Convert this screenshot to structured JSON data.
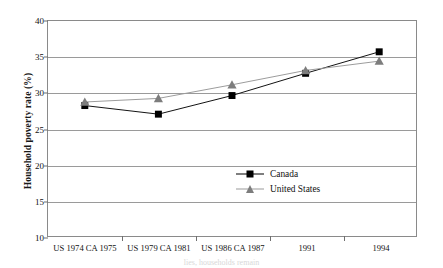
{
  "chart_data": {
    "type": "line",
    "title": "",
    "xlabel": "",
    "ylabel": "Household poverty rate (%)",
    "categories": [
      "US 1974 CA 1975",
      "US 1979 CA 1981",
      "US 1986 CA 1987",
      "1991",
      "1994"
    ],
    "series": [
      {
        "name": "Canada",
        "values": [
          28.2,
          27.0,
          29.6,
          32.7,
          35.7
        ],
        "color": "#000000",
        "marker": "square"
      },
      {
        "name": "United States",
        "values": [
          28.7,
          29.2,
          31.1,
          33.1,
          34.4
        ],
        "color": "#7d7d7d",
        "marker": "triangle"
      }
    ],
    "ylim": [
      10,
      40
    ],
    "yticks": [
      10,
      15,
      20,
      25,
      30,
      35,
      40
    ],
    "ytick_labels": [
      "10",
      "15",
      "20",
      "25",
      "30",
      "35",
      "40"
    ],
    "grid": true,
    "legend_position": "inside-right"
  },
  "legend": {
    "items": [
      {
        "label": "Canada",
        "marker": "square-marker-icon"
      },
      {
        "label": "United States",
        "marker": "triangle-marker-icon"
      }
    ]
  },
  "bleed_caption": "lies, households remain"
}
